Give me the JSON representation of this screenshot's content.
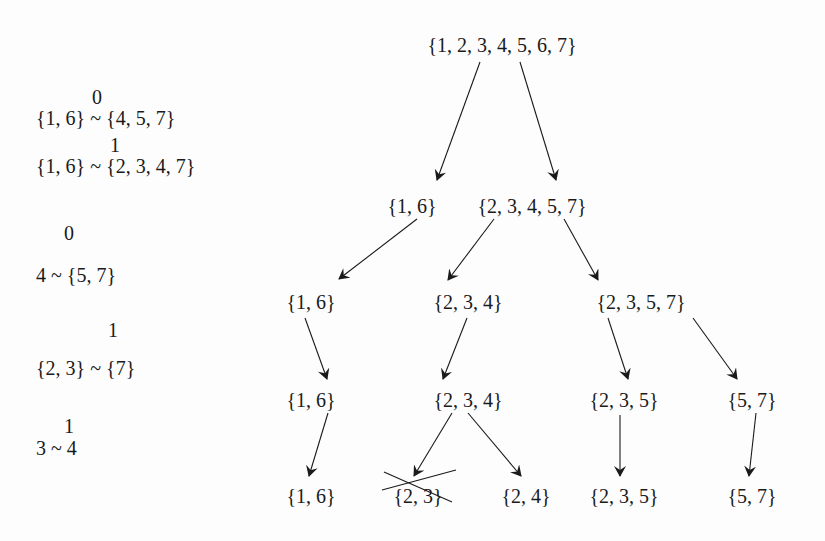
{
  "equivalences": [
    {
      "index": "0",
      "lhs": "{1, 6}",
      "rel": "~",
      "rhs": "{4, 5, 7}"
    },
    {
      "index": "1",
      "lhs": "{1, 6}",
      "rel": "~",
      "rhs": "{2, 3, 4, 7}"
    },
    {
      "index": "0",
      "lhs": "4",
      "rel": "~",
      "rhs": "{5, 7}"
    },
    {
      "index": "1",
      "lhs": "{2, 3}",
      "rel": "~",
      "rhs": "{7}"
    },
    {
      "index": "1",
      "lhs": "3",
      "rel": "~",
      "rhs": "4"
    }
  ],
  "tree": {
    "root": "{1, 2, 3, 4, 5, 6, 7}",
    "level1": [
      "{1, 6}",
      "{2, 3, 4, 5, 7}"
    ],
    "level2": [
      "{1, 6}",
      "{2, 3, 4}",
      "{2, 3, 5, 7}"
    ],
    "level3": [
      "{1, 6}",
      "{2, 3, 4}",
      "{2, 3, 5}",
      "{5, 7}"
    ],
    "level4": [
      "{1, 6}",
      "{2, 3}",
      "{2, 4}",
      "{2, 3, 5}",
      "{5, 7}"
    ],
    "struck_out": [
      "{2, 3}"
    ]
  },
  "colors": {
    "ink": "#1a1a1a",
    "background": "#fdfdfd"
  }
}
